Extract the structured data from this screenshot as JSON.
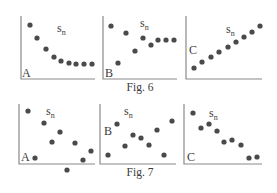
{
  "figures": [
    {
      "caption": "Fig. 6",
      "caption_pos": [
        140,
        91
      ],
      "panels": [
        {
          "letter": "A",
          "letter_pos": [
            22,
            77
          ],
          "label_base": "s",
          "label_sub": "n",
          "label_pos": [
            57,
            32
          ],
          "axis": {
            "x0": 21,
            "y0": 79,
            "x1": 95,
            "ytop": 16
          },
          "dots": [
            [
              30,
              25
            ],
            [
              37,
              38
            ],
            [
              46,
              49
            ],
            [
              54,
              57
            ],
            [
              61,
              61
            ],
            [
              69,
              63
            ],
            [
              76,
              64
            ],
            [
              84,
              64
            ],
            [
              92,
              64
            ]
          ]
        },
        {
          "letter": "B",
          "letter_pos": [
            105,
            77
          ],
          "label_base": "s",
          "label_sub": "n",
          "label_pos": [
            140,
            27
          ],
          "axis": {
            "x0": 103,
            "y0": 79,
            "x1": 177,
            "ytop": 16
          },
          "dots": [
            [
              111,
              26
            ],
            [
              118,
              63
            ],
            [
              126,
              33
            ],
            [
              135,
              51
            ],
            [
              143,
              38
            ],
            [
              151,
              45
            ],
            [
              158,
              40
            ],
            [
              166,
              40
            ],
            [
              174,
              40
            ]
          ]
        },
        {
          "letter": "C",
          "letter_pos": [
            189,
            54
          ],
          "label_base": "s",
          "label_sub": "n",
          "label_pos": [
            226,
            33
          ],
          "axis": {
            "x0": 186,
            "y0": 79,
            "x1": 262,
            "ytop": 16
          },
          "dots": [
            [
              194,
              68
            ],
            [
              202,
              62
            ],
            [
              211,
              57
            ],
            [
              219,
              52
            ],
            [
              228,
              47
            ],
            [
              236,
              42
            ],
            [
              244,
              37
            ],
            [
              252,
              32
            ],
            [
              260,
              26
            ]
          ]
        }
      ]
    },
    {
      "caption": "Fig. 7",
      "caption_pos": [
        140,
        176
      ],
      "panels": [
        {
          "letter": "A",
          "letter_pos": [
            21,
            161
          ],
          "label_base": "s",
          "label_sub": "n",
          "label_pos": [
            46,
            115
          ],
          "axis": {
            "x0": 19,
            "y0": 164,
            "x1": 95,
            "ytop": 104
          },
          "dots": [
            [
              28,
              111
            ],
            [
              35,
              158
            ],
            [
              44,
              123
            ],
            [
              52,
              142
            ],
            [
              60,
              132
            ],
            [
              67,
              170
            ],
            [
              75,
              143
            ],
            [
              83,
              160
            ],
            [
              91,
              151
            ]
          ]
        },
        {
          "letter": "B",
          "letter_pos": [
            104,
            135
          ],
          "label_base": "s",
          "label_sub": "n",
          "label_pos": [
            124,
            115
          ],
          "axis": {
            "x0": 100,
            "y0": 164,
            "x1": 176,
            "ytop": 104
          },
          "dots": [
            [
              108,
              155
            ],
            [
              117,
              124
            ],
            [
              125,
              146
            ],
            [
              133,
              135
            ],
            [
              141,
              138
            ],
            [
              149,
              145
            ],
            [
              157,
              130
            ],
            [
              164,
              155
            ],
            [
              172,
              121
            ]
          ]
        },
        {
          "letter": "C",
          "letter_pos": [
            187,
            161
          ],
          "label_base": "s",
          "label_sub": "n",
          "label_pos": [
            209,
            117
          ],
          "axis": {
            "x0": 184,
            "y0": 164,
            "x1": 262,
            "ytop": 104
          },
          "dots": [
            [
              193,
              113
            ],
            [
              201,
              128
            ],
            [
              209,
              124
            ],
            [
              217,
              131
            ],
            [
              224,
              142
            ],
            [
              232,
              140
            ],
            [
              241,
              145
            ],
            [
              249,
              158
            ],
            [
              257,
              157
            ]
          ]
        }
      ]
    }
  ],
  "chart_data": [
    {
      "type": "scatter",
      "title": "Fig. 6 A",
      "ylabel": "s_n",
      "x": [
        1,
        2,
        3,
        4,
        5,
        6,
        7,
        8,
        9
      ],
      "values": [
        9.2,
        6.8,
        4.9,
        3.5,
        2.8,
        2.5,
        2.3,
        2.3,
        2.3
      ],
      "grid": false
    },
    {
      "type": "scatter",
      "title": "Fig. 6 B",
      "ylabel": "s_n",
      "x": [
        1,
        2,
        3,
        4,
        5,
        6,
        7,
        8,
        9
      ],
      "values": [
        9.0,
        2.8,
        7.8,
        4.7,
        6.8,
        5.7,
        6.5,
        6.5,
        6.5
      ],
      "grid": false
    },
    {
      "type": "scatter",
      "title": "Fig. 6 C",
      "ylabel": "s_n",
      "x": [
        1,
        2,
        3,
        4,
        5,
        6,
        7,
        8,
        9
      ],
      "values": [
        1.8,
        2.8,
        3.7,
        4.5,
        5.3,
        6.2,
        7.0,
        7.8,
        8.8
      ],
      "grid": false
    },
    {
      "type": "scatter",
      "title": "Fig. 7 A",
      "ylabel": "s_n",
      "x": [
        1,
        2,
        3,
        4,
        5,
        6,
        7,
        8,
        9
      ],
      "values": [
        8.8,
        1.0,
        6.8,
        3.7,
        5.3,
        -1.0,
        3.5,
        0.7,
        2.2
      ],
      "grid": false
    },
    {
      "type": "scatter",
      "title": "Fig. 7 B",
      "ylabel": "s_n",
      "x": [
        1,
        2,
        3,
        4,
        5,
        6,
        7,
        8,
        9
      ],
      "values": [
        1.5,
        6.7,
        3.0,
        4.8,
        4.3,
        3.2,
        5.7,
        1.5,
        7.2
      ],
      "grid": false
    },
    {
      "type": "scatter",
      "title": "Fig. 7 C",
      "ylabel": "s_n",
      "x": [
        1,
        2,
        3,
        4,
        5,
        6,
        7,
        8,
        9
      ],
      "values": [
        8.5,
        6.0,
        6.7,
        5.5,
        3.7,
        4.0,
        3.2,
        1.0,
        1.2
      ],
      "grid": false
    }
  ]
}
